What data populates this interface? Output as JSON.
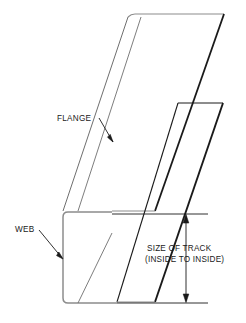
{
  "diagram": {
    "background_color": "#ffffff",
    "line_color": "#1a1a1a",
    "light_line_color": "#8c8c8c",
    "labels": {
      "flange": "FLANGE",
      "web": "WEB"
    },
    "dimension": {
      "line_1": "SIZE OF TRACK",
      "line_2": "(INSIDE TO INSIDE)"
    },
    "icons": {
      "flange_leader": "leader-arrow-icon",
      "web_leader": "leader-arrow-icon",
      "dim_arrow_up": "arrowhead-up-icon",
      "dim_arrow_down": "arrowhead-down-icon"
    }
  }
}
